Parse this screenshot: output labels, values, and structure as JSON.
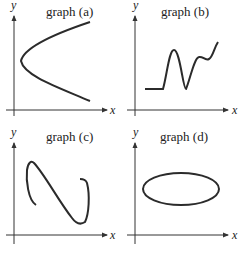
{
  "panels": [
    {
      "id": "a",
      "title": "graph (a)",
      "x_label": "x",
      "y_label": "y",
      "description": "sideways parabola opening to the right"
    },
    {
      "id": "b",
      "title": "graph (b)",
      "x_label": "x",
      "y_label": "y",
      "description": "flat segment then oscillating rising curve"
    },
    {
      "id": "c",
      "title": "graph (c)",
      "x_label": "x",
      "y_label": "y",
      "description": "S-shaped curve with hooked ends"
    },
    {
      "id": "d",
      "title": "graph (d)",
      "x_label": "x",
      "y_label": "y",
      "description": "closed ellipse"
    }
  ],
  "colors": {
    "curve": "#2b2b2b",
    "axis": "#333333",
    "text": "#222222"
  }
}
